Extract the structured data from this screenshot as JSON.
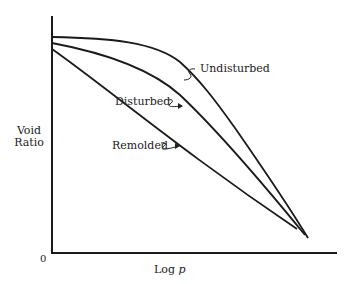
{
  "diagram": {
    "type": "consolidation-curves",
    "axes": {
      "y_label_line1": "Void",
      "y_label_line2": "Ratio",
      "x_label_prefix": "Log",
      "x_label_var": "p",
      "origin_label": "0"
    },
    "curves": [
      {
        "name": "Undisturbed",
        "label": "Undisturbed"
      },
      {
        "name": "Disturbed",
        "label": "Disturbed"
      },
      {
        "name": "Remolded",
        "label": "Remolded"
      }
    ],
    "colors": {
      "line": "#1a1a1a",
      "text": "#222222",
      "background": "#ffffff"
    }
  }
}
